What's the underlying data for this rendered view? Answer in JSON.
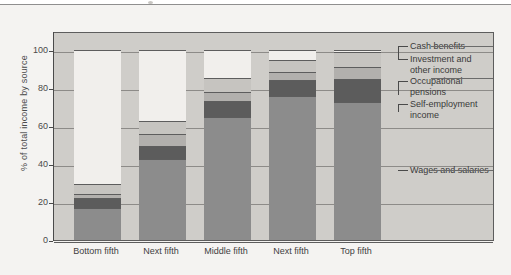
{
  "chart_data": {
    "type": "bar",
    "subtype": "stacked-100-percent",
    "title": "",
    "xlabel": "",
    "ylabel": "% of total income by source",
    "ylim": [
      0,
      100
    ],
    "yticks": [
      0,
      20,
      40,
      60,
      80,
      100
    ],
    "ytick_labels": [
      "0",
      "20",
      "40",
      "60",
      "80",
      "100"
    ],
    "grid": true,
    "legend_position": "right",
    "categories": [
      "Bottom fifth",
      "Next fifth",
      "Middle fifth",
      "Next fifth",
      "Top fifth"
    ],
    "series": [
      {
        "name": "Wages and salaries",
        "values": [
          17.0,
          42.5,
          65.0,
          76.0,
          72.5
        ]
      },
      {
        "name": "Self-employment income",
        "values": [
          5.0,
          7.0,
          8.0,
          8.0,
          12.0
        ]
      },
      {
        "name": "Occupational pensions",
        "values": [
          2.0,
          6.5,
          5.0,
          4.5,
          6.5
        ]
      },
      {
        "name": "Investment and other income",
        "values": [
          5.5,
          6.5,
          7.5,
          6.0,
          8.0
        ]
      },
      {
        "name": "Cash benefits",
        "values": [
          70.5,
          37.5,
          14.5,
          5.5,
          1.0
        ]
      }
    ],
    "cumulative_tops": {
      "Bottom fifth": [
        17.0,
        22.0,
        24.0,
        29.5,
        100.0
      ],
      "Next fifth": [
        42.5,
        49.5,
        56.0,
        62.5,
        100.0
      ],
      "Middle fifth": [
        65.0,
        73.0,
        78.0,
        85.5,
        100.0
      ],
      "Next fifth ": [
        76.0,
        84.0,
        88.5,
        94.5,
        100.0
      ],
      "Top fifth": [
        72.5,
        84.5,
        91.0,
        99.0,
        100.0
      ]
    },
    "colors": {
      "wages_and_salaries": "#8c8c8c",
      "self_employment_income": "#5c5c5c",
      "occupational_pensions": "#b2b0ad",
      "investment_and_other_income": "#c6c4c0",
      "cash_benefits": "#f1efec",
      "plot_background": "#cfcdc9",
      "page_background": "#f4f3f1",
      "axis": "#4a4a4a",
      "gridline": "#8d8b88"
    }
  },
  "legend": {
    "items": [
      {
        "label": "Cash benefits"
      },
      {
        "label": "Investment and",
        "label2": "other income"
      },
      {
        "label": "Occupational",
        "label2": "pensions"
      },
      {
        "label": "Self-employment",
        "label2": "income"
      },
      {
        "label": "Wages and salaries"
      }
    ]
  }
}
